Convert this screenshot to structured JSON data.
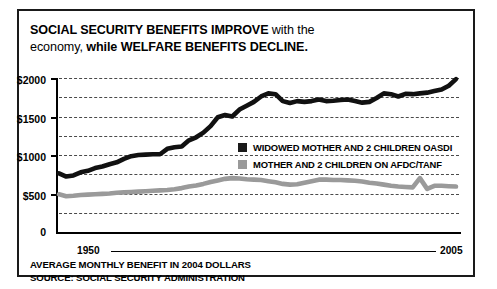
{
  "title": {
    "line1_bold": "SOCIAL SECURITY BENEFITS IMPROVE",
    "line1_regular": " with the",
    "line2_regular": "economy,",
    "line2_bold": " while WELFARE BENEFITS DECLINE."
  },
  "caption": {
    "line1": "AVERAGE MONTHLY BENEFIT IN 2004 DOLLARS",
    "line2": "SOURCE: SOCIAL SECURITY ADMINISTRATION"
  },
  "axis": {
    "x_start_label": "1950",
    "x_end_label": "2005",
    "y_labels": [
      "$2000",
      "$1500",
      "$1000",
      "$500",
      "0"
    ]
  },
  "legend": {
    "items": [
      {
        "label": "WIDOWED MOTHER AND 2 CHILDREN OASDI",
        "color": "#1a1a1a"
      },
      {
        "label": "MOTHER AND 2 CHILDREN ON AFDC/TANF",
        "color": "#9a9a9a"
      }
    ]
  },
  "colors": {
    "oasdi": "#111111",
    "afdc": "#9a9a9a",
    "frame": "#1a1a1a",
    "grid": "#4a4a4a",
    "background": "#ffffff"
  },
  "chart_data": {
    "type": "line",
    "title": "SOCIAL SECURITY BENEFITS IMPROVE with the economy, while WELFARE BENEFITS DECLINE.",
    "subtitle": "AVERAGE MONTHLY BENEFIT IN 2004 DOLLARS",
    "xlabel": "",
    "ylabel": "",
    "xlim": [
      1950,
      2005
    ],
    "ylim": [
      0,
      2000
    ],
    "grid": true,
    "gridline_values": [
      2000,
      1750,
      1500,
      1250,
      1000,
      750,
      500,
      250
    ],
    "ytick_values": [
      2000,
      1500,
      1000,
      500,
      0
    ],
    "xtick_labels": [
      "1950",
      "2005"
    ],
    "legend_position": "center-right",
    "source": "SOURCE: SOCIAL SECURITY ADMINISTRATION",
    "x": [
      1950,
      1951,
      1952,
      1953,
      1954,
      1955,
      1956,
      1957,
      1958,
      1959,
      1960,
      1961,
      1962,
      1963,
      1964,
      1965,
      1966,
      1967,
      1968,
      1969,
      1970,
      1971,
      1972,
      1973,
      1974,
      1975,
      1976,
      1977,
      1978,
      1979,
      1980,
      1981,
      1982,
      1983,
      1984,
      1985,
      1986,
      1987,
      1988,
      1989,
      1990,
      1991,
      1992,
      1993,
      1994,
      1995,
      1996,
      1997,
      1998,
      1999,
      2000,
      2001,
      2002,
      2003,
      2004,
      2005
    ],
    "series": [
      {
        "name": "WIDOWED MOTHER AND 2 CHILDREN OASDI",
        "color": "#111111",
        "values": [
          760,
          720,
          735,
          775,
          795,
          830,
          850,
          880,
          905,
          950,
          985,
          1000,
          1005,
          1010,
          1010,
          1080,
          1100,
          1110,
          1190,
          1230,
          1290,
          1375,
          1490,
          1520,
          1500,
          1590,
          1640,
          1690,
          1760,
          1800,
          1790,
          1700,
          1675,
          1700,
          1690,
          1700,
          1720,
          1700,
          1705,
          1715,
          1720,
          1700,
          1680,
          1690,
          1740,
          1800,
          1790,
          1760,
          1795,
          1790,
          1800,
          1810,
          1830,
          1850,
          1900,
          1985
        ]
      },
      {
        "name": "MOTHER AND 2 CHILDREN ON AFDC/TANF",
        "color": "#9a9a9a",
        "values": [
          490,
          465,
          470,
          480,
          485,
          490,
          495,
          500,
          510,
          515,
          520,
          525,
          530,
          535,
          540,
          545,
          555,
          570,
          590,
          605,
          625,
          650,
          670,
          690,
          700,
          695,
          685,
          680,
          675,
          660,
          645,
          625,
          615,
          620,
          640,
          660,
          680,
          680,
          675,
          675,
          670,
          665,
          655,
          640,
          630,
          615,
          600,
          590,
          585,
          580,
          700,
          560,
          600,
          600,
          595,
          590
        ]
      }
    ]
  }
}
